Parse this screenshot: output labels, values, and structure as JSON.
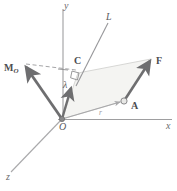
{
  "figure": {
    "type": "vector-mechanics-diagram",
    "background_color": "#ffffff",
    "stroke_color": "#808082",
    "bold_vector_color": "#6e6e70",
    "thin_line_color": "#b9b9bb",
    "parallelogram_fill": "#f2f2f0",
    "parallelogram_stroke": "#cfcfcd"
  },
  "axes": {
    "x": {
      "label": "x",
      "from": [
        62,
        119
      ],
      "to": [
        172,
        119
      ]
    },
    "y": {
      "label": "y",
      "from": [
        63,
        119
      ],
      "to": [
        63,
        9
      ]
    },
    "z": {
      "label": "z",
      "from": [
        62,
        119
      ],
      "to": [
        10,
        172
      ]
    }
  },
  "labels": {
    "origin": "O",
    "line_of_action": "L",
    "point_a": "A",
    "point_c": "C",
    "force": "F",
    "moment": "M",
    "moment_sub": "O",
    "lambda": "λ",
    "position_vector": "r",
    "x_axis": "x",
    "y_axis": "y",
    "z_axis": "z"
  },
  "vectors": [
    {
      "name": "force-F",
      "label": "F",
      "from": [
        124,
        101
      ],
      "to": [
        152,
        58
      ],
      "style": "bold-arrow"
    },
    {
      "name": "moment-MO",
      "label": "M_O",
      "from": [
        62,
        119
      ],
      "to": [
        23,
        63
      ],
      "style": "bold-arrow"
    },
    {
      "name": "lambda-unit",
      "label": "λ",
      "from": [
        62,
        119
      ],
      "to": [
        72,
        84
      ],
      "style": "bold-arrow"
    },
    {
      "name": "position-r",
      "label": "r",
      "from": [
        62,
        119
      ],
      "to": [
        124,
        101
      ],
      "style": "thin-arrow"
    }
  ],
  "geometry": {
    "line_L": {
      "from": [
        78,
        82
      ],
      "to": [
        108,
        22
      ]
    },
    "dashed_guide": {
      "from": [
        25,
        64
      ],
      "to": [
        76,
        70
      ]
    },
    "right_angle_marker": {
      "at": [
        76,
        72
      ],
      "size": 7
    },
    "point_c": [
      77,
      71
    ],
    "point_a": [
      124,
      101
    ],
    "parallelogram": [
      [
        62,
        119
      ],
      [
        124,
        101
      ],
      [
        152,
        58
      ],
      [
        78,
        72
      ]
    ]
  }
}
